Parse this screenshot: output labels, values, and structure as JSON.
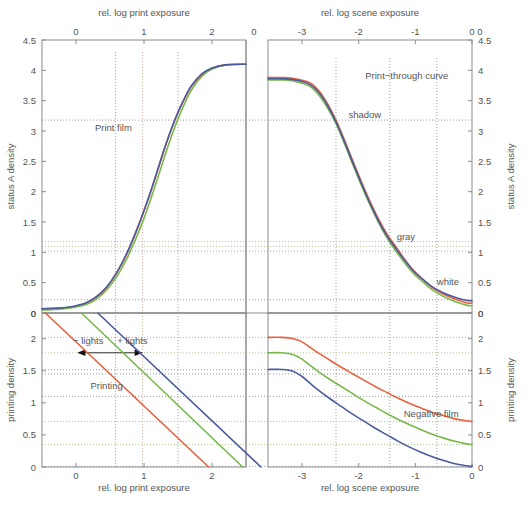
{
  "figure": {
    "background": "#ffffff",
    "axis_color": "#8c8c8c",
    "text_color": "#555555"
  },
  "axes": {
    "top_left_x": {
      "label": "rel. log print exposure",
      "ticks": [
        0,
        1,
        2
      ],
      "tick_labels": [
        "0",
        "1",
        "2"
      ],
      "range": [
        -0.5,
        2.5
      ],
      "position": "top"
    },
    "top_right_x": {
      "label": "rel. log scene exposure",
      "ticks": [
        -3,
        -2,
        -1,
        0
      ],
      "tick_labels": [
        "-3",
        "-2",
        "-1",
        "0"
      ],
      "range": [
        -3.6,
        0.0
      ],
      "position": "top"
    },
    "bottom_left_x": {
      "label": "rel. log print exposure",
      "ticks": [
        0,
        1,
        2
      ],
      "tick_labels": [
        "0",
        "1",
        "2"
      ],
      "range": [
        -0.5,
        2.5
      ],
      "position": "bottom"
    },
    "bottom_right_x": {
      "label": "rel. log scene exposure",
      "ticks": [
        -3,
        -2,
        -1,
        0
      ],
      "tick_labels": [
        "-3",
        "-2",
        "-1",
        "0"
      ],
      "range": [
        -3.6,
        0.0
      ],
      "position": "bottom"
    },
    "top_left_y": {
      "label": "status A density",
      "ticks": [
        0,
        0.5,
        1,
        1.5,
        2,
        2.5,
        3,
        3.5,
        4,
        4.5
      ],
      "tick_labels": [
        "0",
        "0.5",
        "1",
        "1.5",
        "2",
        "2.5",
        "3",
        "3.5",
        "4",
        "4.5"
      ],
      "range": [
        0,
        4.5
      ],
      "position": "left"
    },
    "top_right_y": {
      "label": "status A density",
      "ticks": [
        0,
        0.5,
        1,
        1.5,
        2,
        2.5,
        3,
        3.5,
        4,
        4.5
      ],
      "tick_labels": [
        "0",
        "0.5",
        "1",
        "1.5",
        "2",
        "2.5",
        "3",
        "3.5",
        "4",
        "4.5"
      ],
      "range": [
        0,
        4.5
      ],
      "position": "right"
    },
    "bottom_left_y": {
      "label": "printing density",
      "ticks": [
        0,
        0.5,
        1,
        1.5,
        2
      ],
      "tick_labels": [
        "0",
        "0.5",
        "1",
        "1.5",
        "2"
      ],
      "range": [
        0,
        2.4
      ],
      "inverted": true,
      "position": "left",
      "top_label": "0"
    },
    "bottom_right_y": {
      "label": "printing density",
      "ticks": [
        0,
        0.5,
        1,
        1.5,
        2
      ],
      "tick_labels": [
        "0",
        "0.5",
        "1",
        "1.5",
        "2"
      ],
      "range": [
        0,
        2.4
      ],
      "inverted": true,
      "position": "right",
      "top_label": "0"
    }
  },
  "panels": {
    "top_left": {
      "name": "Print film",
      "label": "Print film"
    },
    "top_right": {
      "name": "Print-through curve",
      "label": "Print−through curve"
    },
    "bottom_left": {
      "name": "Printing",
      "label": "Printing"
    },
    "bottom_right": {
      "name": "Negative film",
      "label": "Negative film"
    }
  },
  "annotations": {
    "shadow": "shadow",
    "gray": "gray",
    "white": "white",
    "minus_lights": "− lights",
    "plus_lights": "+ lights"
  },
  "colors": {
    "red": "#e8603c",
    "green": "#78b84a",
    "blue": "#4a5a9e",
    "dotted_red": "#e8a08c",
    "dotted_green": "#a9cf8e",
    "dotted_blue": "#9aa3c8",
    "dotted_gray": "#9a9a9a",
    "axis": "#8c8c8c",
    "text": "#555555"
  },
  "chart_data": {
    "type": "line",
    "layout": "2x2 quadrants sharing axes; top row status A density, bottom row printing density (inverted)",
    "grid": false,
    "legend": "none",
    "quadrants": [
      {
        "id": "top_left",
        "title": "Print film",
        "xlabel": "rel. log print exposure",
        "ylabel": "status A density",
        "xlim": [
          -0.5,
          2.5
        ],
        "ylim": [
          0,
          4.5
        ],
        "series": [
          {
            "name": "red",
            "color": "#e8603c",
            "x": [
              -0.5,
              -0.3,
              -0.1,
              0.0,
              0.15,
              0.3,
              0.45,
              0.6,
              0.75,
              0.9,
              1.0,
              1.1,
              1.2,
              1.3,
              1.4,
              1.5,
              1.6,
              1.7,
              1.85,
              2.0,
              2.2,
              2.5
            ],
            "y": [
              0.06,
              0.07,
              0.09,
              0.11,
              0.16,
              0.26,
              0.42,
              0.66,
              0.98,
              1.38,
              1.68,
              2.0,
              2.35,
              2.7,
              3.02,
              3.3,
              3.54,
              3.74,
              3.93,
              4.03,
              4.09,
              4.1
            ]
          },
          {
            "name": "green",
            "color": "#78b84a",
            "x": [
              -0.5,
              -0.3,
              -0.1,
              0.0,
              0.15,
              0.3,
              0.45,
              0.6,
              0.75,
              0.9,
              1.0,
              1.1,
              1.2,
              1.3,
              1.4,
              1.5,
              1.6,
              1.7,
              1.85,
              2.0,
              2.2,
              2.5
            ],
            "y": [
              0.05,
              0.06,
              0.08,
              0.1,
              0.14,
              0.23,
              0.38,
              0.6,
              0.9,
              1.28,
              1.56,
              1.88,
              2.22,
              2.57,
              2.9,
              3.2,
              3.46,
              3.68,
              3.9,
              4.02,
              4.09,
              4.1
            ]
          },
          {
            "name": "blue",
            "color": "#4a5a9e",
            "x": [
              -0.5,
              -0.3,
              -0.1,
              0.0,
              0.15,
              0.3,
              0.45,
              0.6,
              0.75,
              0.9,
              1.0,
              1.1,
              1.2,
              1.3,
              1.4,
              1.5,
              1.6,
              1.7,
              1.85,
              2.0,
              2.2,
              2.5
            ],
            "y": [
              0.07,
              0.08,
              0.1,
              0.12,
              0.17,
              0.27,
              0.43,
              0.67,
              0.99,
              1.39,
              1.69,
              2.01,
              2.36,
              2.71,
              3.03,
              3.31,
              3.55,
              3.75,
              3.94,
              4.04,
              4.09,
              4.1
            ]
          }
        ]
      },
      {
        "id": "top_right",
        "title": "Print-through curve",
        "xlabel": "rel. log scene exposure",
        "ylabel": "status A density",
        "xlim": [
          -3.6,
          0.0
        ],
        "ylim": [
          0,
          4.5
        ],
        "annotations": [
          {
            "text": "shadow",
            "x": -2.4,
            "y": 3.18
          },
          {
            "text": "gray",
            "x": -1.45,
            "y": 1.12
          },
          {
            "text": "white",
            "x": -0.55,
            "y": 0.42
          }
        ],
        "series": [
          {
            "name": "red",
            "color": "#e8603c",
            "x": [
              -3.6,
              -3.3,
              -3.05,
              -2.85,
              -2.7,
              -2.55,
              -2.4,
              -2.25,
              -2.1,
              -1.95,
              -1.8,
              -1.65,
              -1.5,
              -1.35,
              -1.2,
              -1.05,
              -0.9,
              -0.7,
              -0.5,
              -0.3,
              -0.1,
              0.0
            ],
            "y": [
              3.88,
              3.88,
              3.85,
              3.79,
              3.66,
              3.45,
              3.18,
              2.85,
              2.5,
              2.16,
              1.84,
              1.55,
              1.3,
              1.1,
              0.9,
              0.72,
              0.58,
              0.42,
              0.31,
              0.23,
              0.17,
              0.16
            ]
          },
          {
            "name": "green",
            "color": "#78b84a",
            "x": [
              -3.6,
              -3.3,
              -3.05,
              -2.85,
              -2.7,
              -2.55,
              -2.4,
              -2.25,
              -2.1,
              -1.95,
              -1.8,
              -1.65,
              -1.5,
              -1.35,
              -1.2,
              -1.05,
              -0.9,
              -0.7,
              -0.5,
              -0.3,
              -0.1,
              0.0
            ],
            "y": [
              3.84,
              3.84,
              3.8,
              3.73,
              3.59,
              3.38,
              3.12,
              2.79,
              2.44,
              2.1,
              1.78,
              1.49,
              1.24,
              1.03,
              0.84,
              0.67,
              0.54,
              0.38,
              0.27,
              0.19,
              0.13,
              0.12
            ]
          },
          {
            "name": "blue",
            "color": "#4a5a9e",
            "x": [
              -3.6,
              -3.3,
              -3.05,
              -2.85,
              -2.7,
              -2.55,
              -2.4,
              -2.25,
              -2.1,
              -1.95,
              -1.8,
              -1.65,
              -1.5,
              -1.35,
              -1.2,
              -1.05,
              -0.9,
              -0.7,
              -0.5,
              -0.3,
              -0.1,
              0.0
            ],
            "y": [
              3.86,
              3.86,
              3.83,
              3.76,
              3.63,
              3.42,
              3.15,
              2.82,
              2.47,
              2.13,
              1.81,
              1.52,
              1.27,
              1.07,
              0.88,
              0.71,
              0.58,
              0.43,
              0.33,
              0.26,
              0.21,
              0.2
            ]
          }
        ]
      },
      {
        "id": "bottom_left",
        "title": "Printing",
        "xlabel": "rel. log print exposure",
        "ylabel": "printing density",
        "xlim": [
          -0.5,
          2.5
        ],
        "ylim": [
          0,
          2.4
        ],
        "inverted_y": true,
        "annotations": [
          {
            "text": "− lights",
            "x": 0.15,
            "y": 0.52
          },
          {
            "text": "+ lights",
            "x": 0.78,
            "y": 0.52
          }
        ],
        "series": [
          {
            "name": "red",
            "color": "#e8603c",
            "x": [
              -0.45,
              1.95
            ],
            "y": [
              0.0,
              2.4
            ]
          },
          {
            "name": "green",
            "color": "#78b84a",
            "x": [
              0.08,
              2.45
            ],
            "y": [
              0.0,
              2.4
            ]
          },
          {
            "name": "blue",
            "color": "#4a5a9e",
            "x": [
              0.32,
              2.72
            ],
            "y": [
              0.0,
              2.4
            ]
          }
        ]
      },
      {
        "id": "bottom_right",
        "title": "Negative film",
        "xlabel": "rel. log scene exposure",
        "ylabel": "printing density",
        "xlim": [
          -3.6,
          0.0
        ],
        "ylim": [
          0,
          2.4
        ],
        "inverted_y": true,
        "series": [
          {
            "name": "red",
            "color": "#e8603c",
            "x": [
              -3.6,
              -3.35,
              -3.15,
              -3.0,
              -2.85,
              -2.7,
              -2.5,
              -2.3,
              -2.1,
              -1.9,
              -1.7,
              -1.5,
              -1.3,
              -1.1,
              -0.9,
              -0.7,
              -0.5,
              -0.3,
              -0.1,
              0.0
            ],
            "y": [
              0.38,
              0.38,
              0.4,
              0.45,
              0.54,
              0.63,
              0.74,
              0.85,
              0.95,
              1.05,
              1.15,
              1.24,
              1.33,
              1.41,
              1.48,
              1.55,
              1.6,
              1.65,
              1.68,
              1.69
            ]
          },
          {
            "name": "green",
            "color": "#78b84a",
            "x": [
              -3.6,
              -3.35,
              -3.15,
              -3.0,
              -2.85,
              -2.7,
              -2.5,
              -2.3,
              -2.1,
              -1.9,
              -1.7,
              -1.5,
              -1.3,
              -1.1,
              -0.9,
              -0.7,
              -0.5,
              -0.3,
              -0.1,
              0.0
            ],
            "y": [
              0.62,
              0.62,
              0.65,
              0.72,
              0.82,
              0.92,
              1.04,
              1.15,
              1.26,
              1.37,
              1.47,
              1.57,
              1.66,
              1.74,
              1.82,
              1.89,
              1.95,
              2.0,
              2.04,
              2.05
            ]
          },
          {
            "name": "blue",
            "color": "#4a5a9e",
            "x": [
              -3.6,
              -3.35,
              -3.15,
              -3.0,
              -2.85,
              -2.7,
              -2.5,
              -2.3,
              -2.1,
              -1.9,
              -1.7,
              -1.5,
              -1.3,
              -1.1,
              -0.9,
              -0.7,
              -0.5,
              -0.3,
              -0.1,
              0.0
            ],
            "y": [
              0.88,
              0.88,
              0.91,
              0.99,
              1.1,
              1.21,
              1.34,
              1.46,
              1.58,
              1.69,
              1.8,
              1.9,
              2.0,
              2.09,
              2.17,
              2.24,
              2.3,
              2.35,
              2.38,
              2.39
            ]
          }
        ]
      }
    ],
    "tie_lines": [
      {
        "name": "shadow-scene",
        "axis": "vertical",
        "panel": "right",
        "x": -2.4,
        "color": "#9a9a9a"
      },
      {
        "name": "gray-scene",
        "axis": "vertical",
        "panel": "right",
        "x": -1.45,
        "color": "#9a9a9a"
      },
      {
        "name": "white-scene",
        "axis": "vertical",
        "panel": "right",
        "x": -0.62,
        "color": "#9a9a9a"
      },
      {
        "name": "shadow-density",
        "axis": "horizontal",
        "panel": "top",
        "y": 3.18,
        "color": "#9a9a9a"
      },
      {
        "name": "gray-density-red",
        "axis": "horizontal",
        "panel": "top",
        "y": 1.18,
        "color": "#e8a08c"
      },
      {
        "name": "gray-density-green",
        "axis": "horizontal",
        "panel": "top",
        "y": 1.1,
        "color": "#a9cf8e"
      },
      {
        "name": "gray-density-blue",
        "axis": "horizontal",
        "panel": "top",
        "y": 1.02,
        "color": "#9aa3c8"
      },
      {
        "name": "white-density",
        "axis": "horizontal",
        "panel": "top",
        "y": 0.22,
        "color": "#9a9a9a"
      },
      {
        "name": "print-exposure-shadow",
        "axis": "vertical",
        "panel": "left",
        "x": 1.5,
        "color": "#9a9a9a"
      },
      {
        "name": "print-exposure-gray",
        "axis": "vertical",
        "panel": "left",
        "x": 0.98,
        "color": "#c8a08c"
      },
      {
        "name": "print-exposure-white",
        "axis": "vertical",
        "panel": "left",
        "x": 0.58,
        "color": "#9a9a9a"
      }
    ]
  }
}
